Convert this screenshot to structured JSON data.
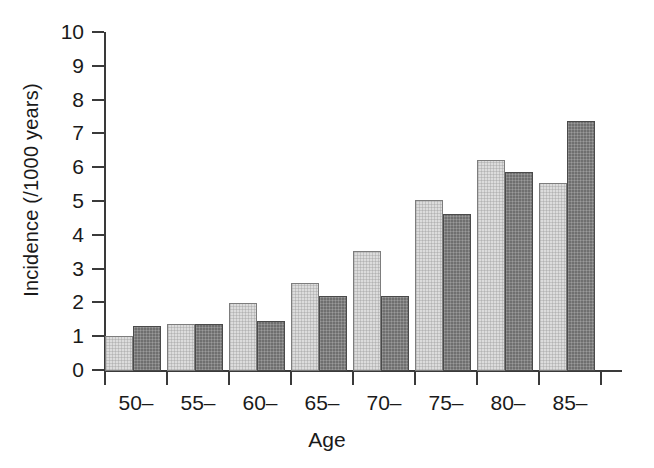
{
  "chart_data": {
    "type": "bar",
    "title": "",
    "xlabel": "Age",
    "ylabel": "Incidence (/1000 years)",
    "categories": [
      "50–",
      "55–",
      "60–",
      "65–",
      "70–",
      "75–",
      "80–",
      "85–"
    ],
    "series": [
      {
        "name": "light-series",
        "color": "#dcdcdc",
        "values": [
          1.05,
          1.38,
          2.0,
          2.6,
          3.55,
          5.05,
          6.25,
          5.55
        ]
      },
      {
        "name": "dark-series",
        "color": "#6f6f6f",
        "values": [
          1.33,
          1.38,
          1.48,
          2.22,
          2.22,
          4.65,
          5.9,
          7.4
        ]
      }
    ],
    "ylim": [
      0,
      10
    ],
    "yticks": [
      0,
      1,
      2,
      3,
      4,
      5,
      6,
      7,
      8,
      9,
      10
    ],
    "ytick_labels": [
      "0",
      "1",
      "2",
      "3",
      "4",
      "5",
      "6",
      "7",
      "8",
      "9",
      "10"
    ],
    "grid": false,
    "legend": "none"
  }
}
